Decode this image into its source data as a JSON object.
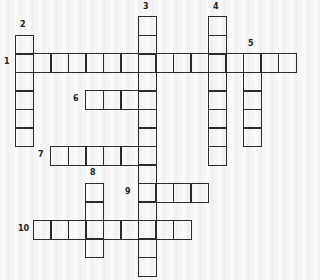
{
  "puzzle": {
    "type": "crossword",
    "cell_w": 17.5,
    "cell_h": 18.5,
    "origin_x": 15,
    "origin_y": 16,
    "entries": [
      {
        "number": "1",
        "direction": "across",
        "col": 0,
        "row": 2,
        "length": 16,
        "label_x": 4,
        "label_y": 58
      },
      {
        "number": "2",
        "direction": "down",
        "col": 0,
        "row": 1,
        "length": 6,
        "label_x": 20,
        "label_y": 21
      },
      {
        "number": "3",
        "direction": "down",
        "col": 7,
        "row": 0,
        "length": 14,
        "label_x": 143,
        "label_y": 3
      },
      {
        "number": "4",
        "direction": "down",
        "col": 11,
        "row": 0,
        "length": 8,
        "label_x": 213,
        "label_y": 3
      },
      {
        "number": "5",
        "direction": "down",
        "col": 13,
        "row": 2,
        "length": 5,
        "label_x": 248,
        "label_y": 40
      },
      {
        "number": "6",
        "direction": "across",
        "col": 4,
        "row": 4,
        "length": 4,
        "label_x": 73,
        "label_y": 95
      },
      {
        "number": "7",
        "direction": "across",
        "col": 2,
        "row": 7,
        "length": 6,
        "label_x": 38,
        "label_y": 151
      },
      {
        "number": "8",
        "direction": "down",
        "col": 4,
        "row": 9,
        "length": 4,
        "label_x": 90,
        "label_y": 169
      },
      {
        "number": "9",
        "direction": "across",
        "col": 7,
        "row": 9,
        "length": 4,
        "label_x": 125,
        "label_y": 188
      },
      {
        "number": "10",
        "direction": "across",
        "col": 1,
        "row": 11,
        "length": 9,
        "label_x": 18,
        "label_y": 225
      }
    ]
  }
}
